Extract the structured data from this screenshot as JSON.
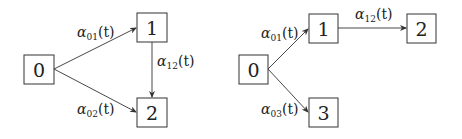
{
  "diagrams": [
    {
      "name": "illness-death-model",
      "nodes": [
        {
          "id": "0",
          "label": "0",
          "x": 24,
          "y": 55,
          "w": 30,
          "h": 29
        },
        {
          "id": "1",
          "label": "1",
          "x": 137,
          "y": 13,
          "w": 30,
          "h": 29
        },
        {
          "id": "2",
          "label": "2",
          "x": 137,
          "y": 98,
          "w": 30,
          "h": 29
        }
      ],
      "edges": [
        {
          "from": "0",
          "to": "1",
          "label": "α",
          "sub": "01",
          "suffix": "(t)"
        },
        {
          "from": "0",
          "to": "2",
          "label": "α",
          "sub": "02",
          "suffix": "(t)"
        },
        {
          "from": "1",
          "to": "2",
          "label": "α",
          "sub": "12",
          "suffix": "(t)"
        }
      ]
    },
    {
      "name": "competing-risks-progression-model",
      "nodes": [
        {
          "id": "0",
          "label": "0",
          "x": 239,
          "y": 55,
          "w": 29,
          "h": 29
        },
        {
          "id": "1",
          "label": "1",
          "x": 309,
          "y": 14,
          "w": 29,
          "h": 29
        },
        {
          "id": "2",
          "label": "2",
          "x": 407,
          "y": 14,
          "w": 29,
          "h": 29
        },
        {
          "id": "3",
          "label": "3",
          "x": 309,
          "y": 98,
          "w": 29,
          "h": 29
        }
      ],
      "edges": [
        {
          "from": "0",
          "to": "1",
          "label": "α",
          "sub": "01",
          "suffix": "(t)"
        },
        {
          "from": "1",
          "to": "2",
          "label": "α",
          "sub": "12",
          "suffix": "(t)"
        },
        {
          "from": "0",
          "to": "3",
          "label": "α",
          "sub": "03",
          "suffix": "(t)"
        }
      ]
    }
  ]
}
